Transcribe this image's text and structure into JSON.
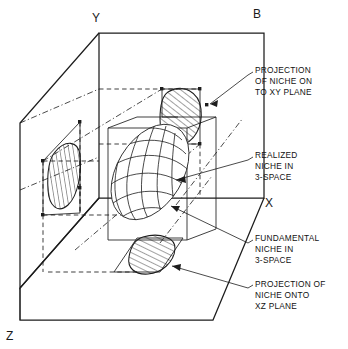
{
  "figure": {
    "kind": "3d-niche-diagram",
    "title_letter": "B",
    "axes": {
      "y": "Y",
      "x": "X",
      "z": "Z",
      "panel": "B"
    },
    "callouts": [
      {
        "id": "xy-projection",
        "lines": [
          "PROJECTION",
          "OF NICHE ON",
          "TO XY PLANE"
        ]
      },
      {
        "id": "realized-niche",
        "lines": [
          "REALIZED",
          "NICHE IN",
          "3-SPACE"
        ]
      },
      {
        "id": "fundamental-niche",
        "lines": [
          "FUNDAMENTAL",
          "NICHE  IN",
          "3-SPACE"
        ]
      },
      {
        "id": "xz-projection",
        "lines": [
          "PROJECTION OF",
          "NICHE ONTO",
          "XZ PLANE"
        ]
      }
    ],
    "colors": {
      "ink": "#1d1d1d",
      "paper": "#ffffff"
    }
  }
}
